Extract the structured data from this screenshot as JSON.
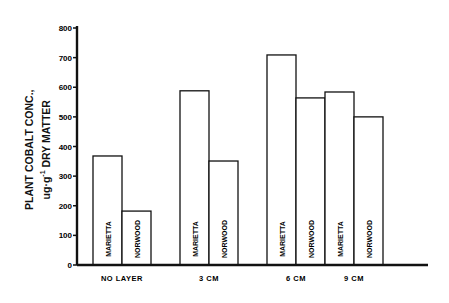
{
  "chart_data": {
    "type": "bar",
    "title": "",
    "xlabel": "",
    "ylabel": "PLANT COBALT CONC., ug·g-1 DRY MATTER",
    "ylabel_line1": "PLANT COBALT CONC.,",
    "ylabel_line2_prefix": "ug·g",
    "ylabel_line2_sup": "-1",
    "ylabel_line2_suffix": " DRY MATTER",
    "ylim": [
      0,
      800
    ],
    "yticks": [
      0,
      100,
      200,
      300,
      400,
      500,
      600,
      700,
      800
    ],
    "grid": false,
    "legend": "none (series names written vertically inside bars)",
    "categories": [
      "NO LAYER",
      "3 CM",
      "6 CM",
      "9 CM"
    ],
    "series": [
      {
        "name": "MARIETTA",
        "values": [
          368,
          588,
          709,
          584
        ]
      },
      {
        "name": "NORWOOD",
        "values": [
          182,
          351,
          564,
          500
        ]
      }
    ]
  }
}
